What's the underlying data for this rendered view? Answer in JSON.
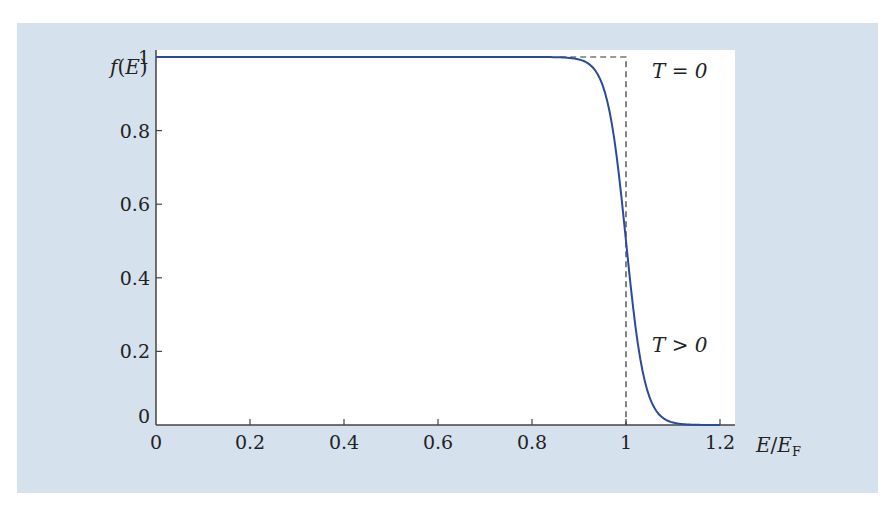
{
  "chart_data": {
    "type": "line",
    "title": "",
    "xlabel": "E/E_F",
    "ylabel": "f(E)",
    "xlim": [
      0,
      1.2
    ],
    "ylim": [
      0,
      1
    ],
    "x_ticks": [
      "0",
      "0.2",
      "0.4",
      "0.6",
      "0.8",
      "1",
      "1.2"
    ],
    "y_ticks": [
      "0",
      "0.2",
      "0.4",
      "0.6",
      "0.8",
      "1"
    ],
    "grid": false,
    "series": [
      {
        "name": "T = 0",
        "style": "dashed",
        "color": "#333333",
        "x": [
          0,
          1,
          1
        ],
        "y": [
          1,
          1,
          0
        ]
      },
      {
        "name": "T > 0",
        "style": "solid",
        "color": "#2b4a9a",
        "x": [
          0,
          0.8,
          0.85,
          0.9,
          0.92,
          0.94,
          0.96,
          0.98,
          1.0,
          1.02,
          1.04,
          1.06,
          1.08,
          1.1,
          1.15,
          1.2
        ],
        "y": [
          1,
          1,
          0.998,
          0.99,
          0.98,
          0.95,
          0.88,
          0.73,
          0.5,
          0.27,
          0.12,
          0.05,
          0.02,
          0.007,
          0.001,
          0
        ]
      }
    ],
    "annotations": [
      {
        "text": "T = 0",
        "x": 1.08,
        "y": 0.97
      },
      {
        "text": "T > 0",
        "x": 1.08,
        "y": 0.15
      }
    ]
  },
  "labels": {
    "ylabel_f": "f",
    "ylabel_open": "(",
    "ylabel_E": "E",
    "ylabel_close": ")",
    "xlabel_E": "E",
    "xlabel_slash": "/",
    "xlabel_EF": "E",
    "xlabel_sub": "F",
    "annot_t0": "T = 0",
    "annot_tpos": "T > 0"
  },
  "colors": {
    "panel": "#d6e1ee",
    "plot_bg": "#ffffff",
    "curve": "#2b4a9a",
    "axis": "#444444"
  }
}
